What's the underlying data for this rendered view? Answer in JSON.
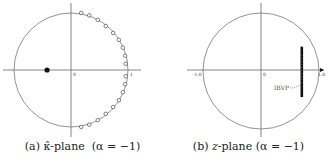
{
  "chart_data": [
    {
      "type": "scatter",
      "title": "",
      "caption": "(a) κ̂-plane (α = −1)",
      "caption_parts": {
        "label": "(a)",
        "variable": "κ̂",
        "plane": "-plane",
        "param": "(α = −1)"
      },
      "xlabel": "",
      "ylabel": "",
      "axes": {
        "xlim": [
          -1.2,
          1.2
        ],
        "ylim": [
          -1.2,
          1.2
        ],
        "grid": false
      },
      "tick_labels": {
        "origin": "0",
        "right": "1"
      },
      "unit_circle": true,
      "series": [
        {
          "name": "filled-point",
          "marker": "filled-circle",
          "points": [
            {
              "x": -0.42,
              "y": 0.0
            }
          ]
        },
        {
          "name": "open-points",
          "marker": "open-circle",
          "points": [
            {
              "x": 0.18,
              "y": 1.0
            },
            {
              "x": 0.32,
              "y": 0.96
            },
            {
              "x": 0.47,
              "y": 0.88
            },
            {
              "x": 0.61,
              "y": 0.77
            },
            {
              "x": 0.74,
              "y": 0.65
            },
            {
              "x": 0.84,
              "y": 0.53
            },
            {
              "x": 0.91,
              "y": 0.39
            },
            {
              "x": 0.95,
              "y": 0.25
            },
            {
              "x": 0.96,
              "y": 0.11
            },
            {
              "x": 0.96,
              "y": -0.11
            },
            {
              "x": 0.95,
              "y": -0.25
            },
            {
              "x": 0.91,
              "y": -0.39
            },
            {
              "x": 0.84,
              "y": -0.53
            },
            {
              "x": 0.74,
              "y": -0.65
            },
            {
              "x": 0.61,
              "y": -0.77
            },
            {
              "x": 0.47,
              "y": -0.88
            },
            {
              "x": 0.32,
              "y": -0.96
            },
            {
              "x": 0.18,
              "y": -1.0
            }
          ]
        }
      ]
    },
    {
      "type": "scatter",
      "title": "",
      "caption": "(b) z-plane (α = −1)",
      "caption_parts": {
        "label": "(b)",
        "variable": "z",
        "plane": "-plane",
        "param": "(α = −1)"
      },
      "xlabel": "",
      "ylabel": "",
      "axes": {
        "xlim": [
          -1.3,
          1.2
        ],
        "ylim": [
          -1.2,
          1.2
        ],
        "grid": false
      },
      "tick_labels": {
        "origin": "0",
        "left": "-1.0",
        "right": "1.0"
      },
      "unit_circle": true,
      "annotations": [
        {
          "text": "IBVP",
          "points_to": {
            "x": 0.7,
            "y": -0.3
          }
        }
      ],
      "series": [
        {
          "name": "IBVP-eigenvalues",
          "marker": "dense-band",
          "x": 0.72,
          "y_range": [
            -0.45,
            0.42
          ]
        },
        {
          "name": "arrow-marker",
          "marker": "right-arrow",
          "points": [
            {
              "x": 1.15,
              "y": 0.0
            }
          ]
        }
      ]
    }
  ],
  "colors": {
    "axis": "#555555",
    "circle": "#777777",
    "points": "#111111",
    "text": "#222222"
  }
}
